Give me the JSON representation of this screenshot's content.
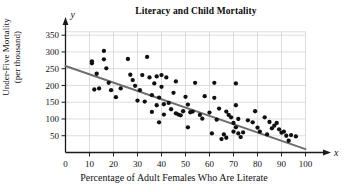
{
  "chart_data": {
    "type": "scatter",
    "title": "Literacy and Child Mortality",
    "xlabel": "Percentage of Adult Females Who Are Literate",
    "ylabel_line1": "Under-Five Mortality",
    "ylabel_line2": "(per thousand)",
    "x_axis_variable": "x",
    "y_axis_variable": "y",
    "xlim": [
      0,
      104
    ],
    "ylim": [
      0,
      375
    ],
    "xticks": [
      0,
      10,
      20,
      30,
      40,
      50,
      60,
      70,
      80,
      90,
      100
    ],
    "yticks": [
      50,
      100,
      150,
      200,
      250,
      300,
      350
    ],
    "grid": true,
    "grid_color": "#cfcfcf",
    "axis_color": "#1a1a1a",
    "point_color": "#101010",
    "trendline_color": "#6d6d6d",
    "legend": null,
    "trendline": {
      "label": "least-squares regression line",
      "x_start": 0,
      "y_start": 258,
      "x_end": 100,
      "y_end": 10
    },
    "points": [
      [
        11,
        266
      ],
      [
        11,
        272
      ],
      [
        12,
        188
      ],
      [
        13,
        235
      ],
      [
        14,
        191
      ],
      [
        16,
        303
      ],
      [
        16,
        278
      ],
      [
        17,
        251
      ],
      [
        18,
        208
      ],
      [
        19,
        186
      ],
      [
        21,
        165
      ],
      [
        23,
        191
      ],
      [
        26,
        279
      ],
      [
        27,
        232
      ],
      [
        28,
        216
      ],
      [
        29,
        199
      ],
      [
        30,
        155
      ],
      [
        31,
        186
      ],
      [
        32,
        231
      ],
      [
        33,
        152
      ],
      [
        34,
        285
      ],
      [
        35,
        224
      ],
      [
        36,
        121
      ],
      [
        36,
        171
      ],
      [
        37,
        206
      ],
      [
        38,
        227
      ],
      [
        38,
        141
      ],
      [
        39,
        164
      ],
      [
        39,
        90
      ],
      [
        40,
        231
      ],
      [
        40,
        196
      ],
      [
        41,
        144
      ],
      [
        41,
        113
      ],
      [
        42,
        224
      ],
      [
        43,
        148
      ],
      [
        44,
        129
      ],
      [
        45,
        178
      ],
      [
        46,
        212
      ],
      [
        46,
        117
      ],
      [
        47,
        113
      ],
      [
        48,
        111
      ],
      [
        49,
        123
      ],
      [
        50,
        166
      ],
      [
        51,
        143
      ],
      [
        51,
        75
      ],
      [
        52,
        120
      ],
      [
        53,
        122
      ],
      [
        54,
        208
      ],
      [
        56,
        112
      ],
      [
        57,
        101
      ],
      [
        58,
        168
      ],
      [
        60,
        119
      ],
      [
        61,
        57
      ],
      [
        62,
        163
      ],
      [
        62,
        208
      ],
      [
        63,
        98
      ],
      [
        64,
        131
      ],
      [
        65,
        40
      ],
      [
        66,
        54
      ],
      [
        67,
        122
      ],
      [
        67,
        44
      ],
      [
        68,
        112
      ],
      [
        69,
        105
      ],
      [
        70,
        88
      ],
      [
        70,
        62
      ],
      [
        71,
        206
      ],
      [
        71,
        141
      ],
      [
        71,
        75
      ],
      [
        72,
        100
      ],
      [
        72,
        57
      ],
      [
        73,
        46
      ],
      [
        74,
        60
      ],
      [
        76,
        96
      ],
      [
        78,
        90
      ],
      [
        79,
        123
      ],
      [
        80,
        74
      ],
      [
        81,
        62
      ],
      [
        83,
        105
      ],
      [
        84,
        54
      ],
      [
        85,
        91
      ],
      [
        86,
        72
      ],
      [
        87,
        80
      ],
      [
        88,
        88
      ],
      [
        89,
        69
      ],
      [
        90,
        59
      ],
      [
        91,
        62
      ],
      [
        92,
        50
      ],
      [
        93,
        35
      ],
      [
        94,
        52
      ],
      [
        96,
        48
      ]
    ]
  }
}
